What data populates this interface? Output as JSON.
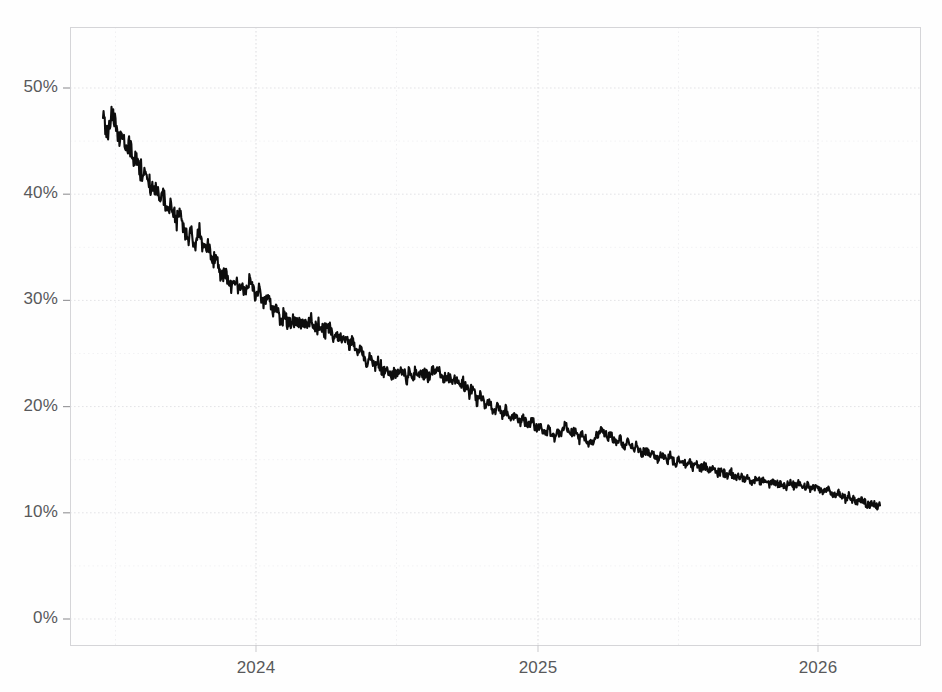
{
  "chart_data": {
    "type": "line",
    "title": "",
    "subtitle": "",
    "xlabel": "",
    "ylabel": "",
    "xlim": [
      "2023-10-20",
      "2026-09-10"
    ],
    "ylim": [
      0,
      55
    ],
    "y_unit": "%",
    "grid": true,
    "legend": null,
    "series_color": "#0d0d0d",
    "grid_color": "#e3e3e6",
    "axis_color": "#d5d5d8",
    "label_color": "#58595b",
    "y_ticks": [
      {
        "value": 0,
        "label": "0%"
      },
      {
        "value": 10,
        "label": "10%"
      },
      {
        "value": 20,
        "label": "20%"
      },
      {
        "value": 30,
        "label": "30%"
      },
      {
        "value": 40,
        "label": "40%"
      },
      {
        "value": 50,
        "label": "50%"
      }
    ],
    "x_ticks": [
      {
        "value": "2024",
        "label": "2024"
      },
      {
        "value": "2025",
        "label": "2025"
      },
      {
        "value": "2026",
        "label": "2026"
      }
    ],
    "minor_x_gridlines": [
      "2023-07",
      "2024-07",
      "2025-07",
      "2026-07"
    ],
    "series": [
      {
        "name": "probability",
        "color": "#0d0d0d",
        "start_label": "2023-11",
        "end_label": "2026-08",
        "start_value": 47.5,
        "end_value": 10.7,
        "max_value": 47.7,
        "min_value": 10.5,
        "values": [
          47.4,
          46.2,
          46.5,
          47.6,
          46.8,
          45.9,
          45.2,
          45.6,
          44.4,
          44.8,
          44.1,
          43.3,
          43.6,
          42.4,
          41.8,
          42.1,
          41.1,
          40.5,
          40.8,
          40.0,
          39.4,
          40.2,
          39.1,
          38.6,
          39.3,
          38.0,
          37.4,
          38.1,
          37.2,
          36.6,
          35.9,
          36.6,
          35.4,
          35.8,
          36.5,
          35.2,
          34.6,
          35.3,
          34.2,
          33.6,
          34.2,
          33.0,
          32.4,
          33.0,
          31.9,
          31.4,
          32.2,
          31.6,
          30.9,
          31.5,
          30.6,
          31.4,
          32.1,
          31.2,
          30.4,
          31.0,
          30.2,
          29.6,
          30.3,
          29.5,
          28.9,
          29.5,
          28.6,
          28.2,
          28.7,
          28.0,
          27.8,
          28.3,
          27.9,
          28.2,
          27.7,
          28.1,
          27.6,
          28.2,
          27.8,
          27.3,
          27.9,
          27.4,
          26.9,
          27.5,
          27.1,
          26.6,
          27.2,
          26.7,
          26.2,
          26.8,
          26.2,
          25.6,
          26.2,
          25.5,
          24.9,
          25.5,
          24.8,
          24.3,
          24.8,
          24.2,
          23.7,
          24.3,
          23.8,
          23.2,
          23.7,
          23.2,
          22.8,
          23.3,
          22.9,
          23.4,
          23.0,
          22.6,
          23.1,
          22.7,
          23.2,
          22.8,
          23.3,
          22.9,
          23.2,
          22.8,
          23.3,
          23.0,
          23.4,
          23.0,
          22.6,
          23.1,
          22.7,
          22.3,
          22.8,
          22.3,
          21.8,
          22.3,
          21.7,
          21.2,
          21.7,
          21.1,
          20.6,
          21.1,
          20.5,
          20.0,
          20.5,
          20.0,
          19.5,
          20.0,
          19.5,
          19.1,
          19.6,
          19.2,
          18.8,
          19.3,
          18.9,
          18.5,
          19.0,
          18.6,
          18.2,
          18.7,
          18.3,
          17.9,
          18.3,
          17.9,
          17.5,
          17.9,
          17.5,
          17.1,
          17.5,
          17.2,
          17.7,
          18.2,
          17.8,
          17.3,
          17.8,
          17.4,
          17.0,
          17.4,
          17.0,
          16.6,
          17.0,
          16.7,
          17.1,
          17.5,
          17.9,
          17.5,
          17.1,
          17.5,
          17.1,
          16.7,
          17.1,
          16.7,
          16.3,
          16.7,
          16.3,
          15.9,
          16.3,
          16.0,
          15.6,
          16.0,
          15.7,
          15.3,
          15.7,
          15.4,
          15.1,
          15.5,
          15.2,
          14.9,
          15.3,
          15.0,
          14.7,
          15.1,
          14.8,
          14.5,
          14.9,
          14.6,
          14.3,
          14.7,
          14.4,
          14.1,
          14.5,
          14.2,
          13.9,
          14.3,
          14.0,
          13.7,
          14.0,
          13.8,
          13.5,
          13.8,
          13.6,
          13.3,
          13.6,
          13.4,
          13.1,
          13.4,
          13.2,
          12.9,
          13.2,
          13.0,
          12.8,
          13.1,
          12.9,
          12.7,
          13.0,
          12.8,
          12.6,
          12.9,
          12.7,
          12.5,
          12.8,
          12.6,
          12.4,
          12.7,
          12.5,
          12.3,
          12.6,
          12.4,
          12.2,
          12.5,
          12.3,
          12.1,
          11.9,
          12.2,
          12.0,
          11.8,
          11.6,
          11.9,
          11.7,
          11.5,
          11.3,
          11.6,
          11.4,
          11.2,
          11.0,
          11.3,
          11.1,
          10.9,
          10.7,
          11.0,
          10.8,
          10.6,
          10.7
        ]
      }
    ]
  }
}
